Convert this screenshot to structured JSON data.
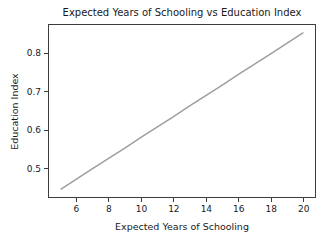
{
  "chart_data": {
    "type": "line",
    "title": "Expected Years of Schooling vs Education Index",
    "xlabel": "Expected Years of Schooling",
    "ylabel": "Education Index",
    "x": [
      5,
      6,
      7,
      8,
      9,
      10,
      11,
      12,
      13,
      14,
      15,
      16,
      17,
      18,
      19,
      20
    ],
    "y": [
      0.445,
      0.472,
      0.5,
      0.527,
      0.554,
      0.582,
      0.609,
      0.636,
      0.664,
      0.691,
      0.718,
      0.746,
      0.773,
      0.8,
      0.828,
      0.855
    ],
    "xlim": [
      4.25,
      20.75
    ],
    "ylim": [
      0.424,
      0.876
    ],
    "xticks": [
      6,
      8,
      10,
      12,
      14,
      16,
      18,
      20
    ],
    "yticks": [
      0.5,
      0.6,
      0.7,
      0.8
    ],
    "grid": false,
    "legend": "none",
    "line_color": "#9e9e9e",
    "line_width": 1.5,
    "axis_color": "#3d3d3d",
    "text_color": "#1a1a1a",
    "background_color": "#ffffff"
  }
}
